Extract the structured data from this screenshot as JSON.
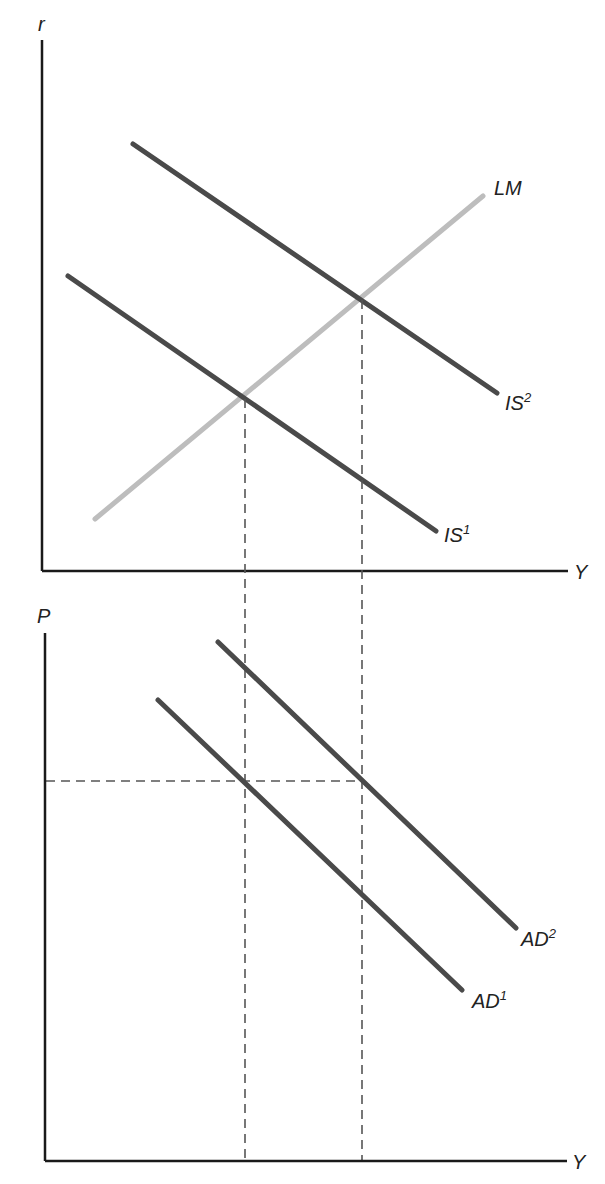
{
  "top_panel": {
    "y_axis_label": "r",
    "x_axis_label": "Y",
    "curves": {
      "lm": {
        "label": "LM",
        "color": "#bdbdbd"
      },
      "is1": {
        "label": "IS",
        "sup": "1",
        "color": "#4a4a4a"
      },
      "is2": {
        "label": "IS",
        "sup": "2",
        "color": "#4a4a4a"
      }
    }
  },
  "bottom_panel": {
    "y_axis_label": "P",
    "x_axis_label": "Y",
    "curves": {
      "ad1": {
        "label": "AD",
        "sup": "1",
        "color": "#4a4a4a"
      },
      "ad2": {
        "label": "AD",
        "sup": "2",
        "color": "#4a4a4a"
      }
    }
  },
  "colors": {
    "axis": "#1a1a1a",
    "dashed": "#555555"
  }
}
